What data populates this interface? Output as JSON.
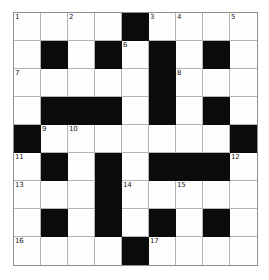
{
  "puzzle": {
    "title": "Crossword Grid",
    "type": "crossword",
    "rows": 9,
    "cols": 9,
    "cell_size_px": 27,
    "colors": {
      "block": "#0b0b0b",
      "cell": "#fefefe",
      "gridline": "#b4b4b4",
      "border": "#8e8e8e",
      "number_text": "#1a1a1a"
    },
    "max_clue_number": 17,
    "grid": [
      [
        {
          "block": false,
          "num": "1"
        },
        {
          "block": false,
          "num": ""
        },
        {
          "block": false,
          "num": "2"
        },
        {
          "block": false,
          "num": ""
        },
        {
          "block": true,
          "num": ""
        },
        {
          "block": false,
          "num": "3"
        },
        {
          "block": false,
          "num": "4"
        },
        {
          "block": false,
          "num": ""
        },
        {
          "block": false,
          "num": "5"
        }
      ],
      [
        {
          "block": false,
          "num": ""
        },
        {
          "block": true,
          "num": ""
        },
        {
          "block": false,
          "num": ""
        },
        {
          "block": true,
          "num": ""
        },
        {
          "block": false,
          "num": "6"
        },
        {
          "block": true,
          "num": ""
        },
        {
          "block": false,
          "num": ""
        },
        {
          "block": true,
          "num": ""
        },
        {
          "block": false,
          "num": ""
        }
      ],
      [
        {
          "block": false,
          "num": "7"
        },
        {
          "block": false,
          "num": ""
        },
        {
          "block": false,
          "num": ""
        },
        {
          "block": false,
          "num": ""
        },
        {
          "block": false,
          "num": ""
        },
        {
          "block": true,
          "num": ""
        },
        {
          "block": false,
          "num": "8"
        },
        {
          "block": false,
          "num": ""
        },
        {
          "block": false,
          "num": ""
        }
      ],
      [
        {
          "block": false,
          "num": ""
        },
        {
          "block": true,
          "num": ""
        },
        {
          "block": true,
          "num": ""
        },
        {
          "block": true,
          "num": ""
        },
        {
          "block": false,
          "num": ""
        },
        {
          "block": true,
          "num": ""
        },
        {
          "block": false,
          "num": ""
        },
        {
          "block": true,
          "num": ""
        },
        {
          "block": false,
          "num": ""
        }
      ],
      [
        {
          "block": true,
          "num": ""
        },
        {
          "block": false,
          "num": "9"
        },
        {
          "block": false,
          "num": "10"
        },
        {
          "block": false,
          "num": ""
        },
        {
          "block": false,
          "num": ""
        },
        {
          "block": false,
          "num": ""
        },
        {
          "block": false,
          "num": ""
        },
        {
          "block": false,
          "num": ""
        },
        {
          "block": true,
          "num": ""
        }
      ],
      [
        {
          "block": false,
          "num": "11"
        },
        {
          "block": true,
          "num": ""
        },
        {
          "block": false,
          "num": ""
        },
        {
          "block": true,
          "num": ""
        },
        {
          "block": false,
          "num": ""
        },
        {
          "block": true,
          "num": ""
        },
        {
          "block": true,
          "num": ""
        },
        {
          "block": true,
          "num": ""
        },
        {
          "block": false,
          "num": "12"
        }
      ],
      [
        {
          "block": false,
          "num": "13"
        },
        {
          "block": false,
          "num": ""
        },
        {
          "block": false,
          "num": ""
        },
        {
          "block": true,
          "num": ""
        },
        {
          "block": false,
          "num": "14"
        },
        {
          "block": false,
          "num": ""
        },
        {
          "block": false,
          "num": "15"
        },
        {
          "block": false,
          "num": ""
        },
        {
          "block": false,
          "num": ""
        }
      ],
      [
        {
          "block": false,
          "num": ""
        },
        {
          "block": true,
          "num": ""
        },
        {
          "block": false,
          "num": ""
        },
        {
          "block": true,
          "num": ""
        },
        {
          "block": false,
          "num": ""
        },
        {
          "block": true,
          "num": ""
        },
        {
          "block": false,
          "num": ""
        },
        {
          "block": true,
          "num": ""
        },
        {
          "block": false,
          "num": ""
        }
      ],
      [
        {
          "block": false,
          "num": "16"
        },
        {
          "block": false,
          "num": ""
        },
        {
          "block": false,
          "num": ""
        },
        {
          "block": false,
          "num": ""
        },
        {
          "block": true,
          "num": ""
        },
        {
          "block": false,
          "num": "17"
        },
        {
          "block": false,
          "num": ""
        },
        {
          "block": false,
          "num": ""
        },
        {
          "block": false,
          "num": ""
        }
      ]
    ]
  }
}
